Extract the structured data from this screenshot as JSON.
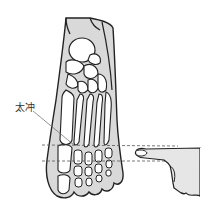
{
  "figure": {
    "acupoint_label": "太冲",
    "colors": {
      "outline": "#222222",
      "soft_tissue": "#d9d9d9",
      "bone_fill": "#ffffff",
      "guide_line": "#555555",
      "background": "#ffffff"
    }
  }
}
